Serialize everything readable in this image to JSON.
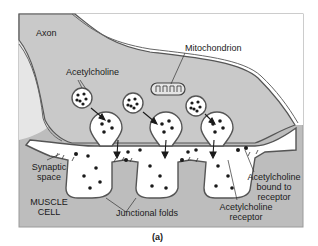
{
  "figure": {
    "caption": "(a)",
    "colors": {
      "axon_fill": "#c9c9c9",
      "muscle_fill": "#bdbdbd",
      "membrane": "#555555",
      "synaptic_space": "#ffffff",
      "background": "#ffffff",
      "dots": "#1a1a1a"
    },
    "labels": {
      "axon": "Axon",
      "mitochondrion": "Mitochondrion",
      "acetylcholine": "Acetylcholine",
      "synaptic_space_1": "Synaptic",
      "synaptic_space_2": "space",
      "muscle_cell_1": "MUSCLE",
      "muscle_cell_2": "CELL",
      "junctional_folds": "Junctional folds",
      "ach_bound_1": "Acetylcholine",
      "ach_bound_2": "bound to",
      "ach_bound_3": "receptor",
      "ach_receptor_1": "Acetylcholine",
      "ach_receptor_2": "receptor"
    }
  }
}
